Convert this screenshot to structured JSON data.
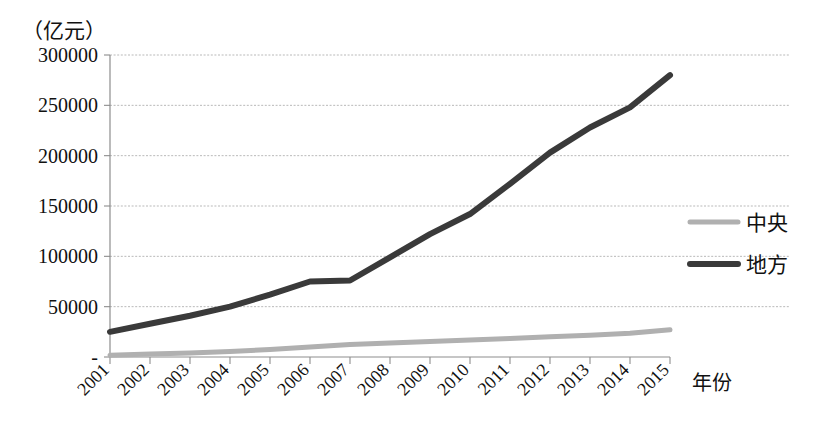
{
  "chart_data": {
    "type": "line",
    "title": "",
    "subtitle": "",
    "unit_label": "（亿元）",
    "xlabel": "年份",
    "ylabel": "",
    "grid": true,
    "legend_position": "right",
    "categories": [
      "2001",
      "2002",
      "2003",
      "2004",
      "2005",
      "2006",
      "2007",
      "2008",
      "2009",
      "2010",
      "2011",
      "2012",
      "2013",
      "2014",
      "2015"
    ],
    "ylim": [
      0,
      300000
    ],
    "yticks": [
      0,
      50000,
      100000,
      150000,
      200000,
      250000,
      300000
    ],
    "ytick_labels": [
      "-",
      "50000",
      "100000",
      "150000",
      "200000",
      "250000",
      "300000"
    ],
    "series": [
      {
        "name": "中央",
        "color": "#b0b0b0",
        "width": 5,
        "values": [
          1800,
          3000,
          4000,
          5500,
          7500,
          10000,
          12500,
          14000,
          15500,
          17000,
          18500,
          20000,
          21500,
          23500,
          27000
        ]
      },
      {
        "name": "地方",
        "color": "#3a3a3a",
        "width": 6,
        "values": [
          25000,
          33000,
          41000,
          50000,
          62000,
          75000,
          76000,
          99000,
          122000,
          142000,
          172000,
          203000,
          228000,
          248000,
          280000
        ]
      }
    ]
  },
  "legend": {
    "items": [
      {
        "label": "中央",
        "color": "#b0b0b0"
      },
      {
        "label": "地方",
        "color": "#3a3a3a"
      }
    ]
  },
  "axes": {
    "y_unit": "（亿元）",
    "x_title": "年份"
  }
}
